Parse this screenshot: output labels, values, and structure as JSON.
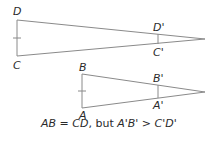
{
  "diagram": {
    "top_triangle": {
      "vertices": {
        "D": "D",
        "C": "C",
        "D_prime": "D'",
        "C_prime": "C'"
      }
    },
    "bottom_triangle": {
      "vertices": {
        "B": "B",
        "A": "A",
        "B_prime": "B'",
        "A_prime": "A'"
      }
    },
    "caption": {
      "lhs": "AB",
      "eq": " = ",
      "mid": "CD",
      "conj": ", but ",
      "rhs1": "A'B'",
      "gt": " > ",
      "rhs2": "C'D'"
    },
    "colors": {
      "line": "#8a8a8a",
      "text": "#2a2a2a"
    }
  }
}
